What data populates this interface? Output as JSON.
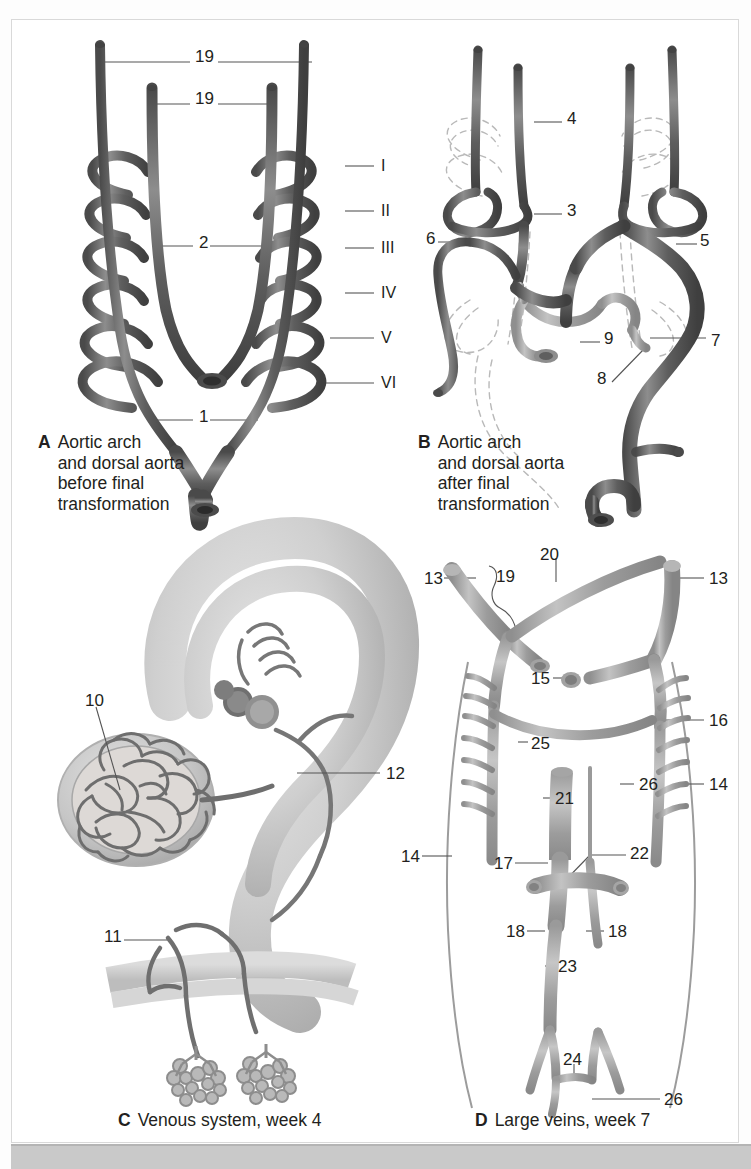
{
  "figure": {
    "domain": "anatomical-plate",
    "background": "#ffffff",
    "border_color": "#d9d9d9",
    "bottom_band_color": "#c9c9c9",
    "ink_color": "#231f20",
    "vessel_dark": "#595959",
    "vessel_mid": "#7a7a7a",
    "vessel_light": "#a8a8a8",
    "tissue_light": "#d2d2d2",
    "dashed_color": "#b9b9b9"
  },
  "panels": [
    {
      "id": "A",
      "letter": "A",
      "caption": "Aortic arch\nand dorsal aorta\nbefore final\ntransformation",
      "caption_x": 38,
      "caption_y": 432,
      "labels": [
        {
          "text": "19",
          "x": 195,
          "y": 48
        },
        {
          "text": "19",
          "x": 195,
          "y": 90
        },
        {
          "text": "2",
          "x": 199,
          "y": 234
        },
        {
          "text": "1",
          "x": 199,
          "y": 408
        },
        {
          "text": "I",
          "x": 381,
          "y": 158,
          "roman": true
        },
        {
          "text": "II",
          "x": 381,
          "y": 203,
          "roman": true
        },
        {
          "text": "III",
          "x": 381,
          "y": 240,
          "roman": true
        },
        {
          "text": "IV",
          "x": 381,
          "y": 285,
          "roman": true
        },
        {
          "text": "V",
          "x": 381,
          "y": 330,
          "roman": true
        },
        {
          "text": "VI",
          "x": 381,
          "y": 375,
          "roman": true
        }
      ]
    },
    {
      "id": "B",
      "letter": "B",
      "caption": "Aortic arch\nand dorsal aorta\nafter final\ntransformation",
      "caption_x": 418,
      "caption_y": 432,
      "labels": [
        {
          "text": "4",
          "x": 567,
          "y": 110
        },
        {
          "text": "3",
          "x": 567,
          "y": 202
        },
        {
          "text": "6",
          "x": 426,
          "y": 230
        },
        {
          "text": "5",
          "x": 700,
          "y": 232
        },
        {
          "text": "9",
          "x": 604,
          "y": 330
        },
        {
          "text": "7",
          "x": 711,
          "y": 332
        },
        {
          "text": "8",
          "x": 597,
          "y": 370
        }
      ]
    },
    {
      "id": "C",
      "letter": "C",
      "caption": "Venous system, week 4",
      "caption_x": 118,
      "caption_y": 1110,
      "labels": [
        {
          "text": "10",
          "x": 85,
          "y": 692
        },
        {
          "text": "12",
          "x": 386,
          "y": 765
        },
        {
          "text": "11",
          "x": 104,
          "y": 928
        }
      ]
    },
    {
      "id": "D",
      "letter": "D",
      "caption": "Large veins, week 7",
      "caption_x": 475,
      "caption_y": 1110,
      "labels": [
        {
          "text": "13",
          "x": 424,
          "y": 570
        },
        {
          "text": "19",
          "x": 496,
          "y": 568
        },
        {
          "text": "20",
          "x": 540,
          "y": 546
        },
        {
          "text": "13",
          "x": 709,
          "y": 570
        },
        {
          "text": "15",
          "x": 531,
          "y": 670
        },
        {
          "text": "16",
          "x": 709,
          "y": 712
        },
        {
          "text": "25",
          "x": 531,
          "y": 735
        },
        {
          "text": "26",
          "x": 639,
          "y": 776
        },
        {
          "text": "14",
          "x": 709,
          "y": 776
        },
        {
          "text": "21",
          "x": 555,
          "y": 790
        },
        {
          "text": "14",
          "x": 401,
          "y": 848
        },
        {
          "text": "17",
          "x": 494,
          "y": 855
        },
        {
          "text": "22",
          "x": 630,
          "y": 845
        },
        {
          "text": "18",
          "x": 506,
          "y": 923
        },
        {
          "text": "18",
          "x": 608,
          "y": 923
        },
        {
          "text": "23",
          "x": 558,
          "y": 958
        },
        {
          "text": "24",
          "x": 563,
          "y": 1051
        },
        {
          "text": "26",
          "x": 664,
          "y": 1091
        }
      ]
    }
  ]
}
